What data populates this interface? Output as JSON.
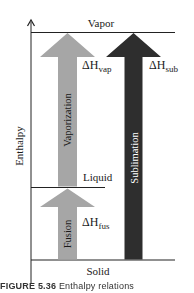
{
  "diagram": {
    "axis_label": "Enthalpy",
    "levels": {
      "vapor": "Vapor",
      "liquid": "Liquid",
      "solid": "Solid"
    },
    "arrows": {
      "vaporization": {
        "label": "Vaporization",
        "delta_symbol": "ΔH",
        "subscript": "vap",
        "color": "#a6a6a6"
      },
      "fusion": {
        "label": "Fusion",
        "delta_symbol": "ΔH",
        "subscript": "fus",
        "color": "#a6a6a6"
      },
      "sublimation": {
        "label": "Sublimation",
        "delta_symbol": "ΔH",
        "subscript": "sub",
        "color": "#2e2e2e"
      }
    },
    "caption": {
      "prefix": "FIGURE 5.36",
      "text": "Enthalpy relations"
    }
  }
}
